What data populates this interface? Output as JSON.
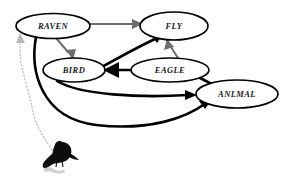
{
  "diagram": {
    "background_color": "#ffffff",
    "nodes": [
      {
        "id": "raven",
        "label": "RAVEN",
        "cx": 53,
        "cy": 26,
        "rx": 37,
        "ry": 12.5
      },
      {
        "id": "fly",
        "label": "FLY",
        "cx": 174,
        "cy": 26,
        "rx": 34,
        "ry": 14
      },
      {
        "id": "bird",
        "label": "BIRD",
        "cx": 74,
        "cy": 70,
        "rx": 31,
        "ry": 12
      },
      {
        "id": "eagle",
        "label": "EAGLE",
        "cx": 170,
        "cy": 70,
        "rx": 39,
        "ry": 12
      },
      {
        "id": "animal",
        "label": "ANLMAL",
        "cx": 237,
        "cy": 94,
        "rx": 41,
        "ry": 14
      }
    ],
    "edges": [
      {
        "id": "raven-fly",
        "from": "RAVEN",
        "to": "FLY",
        "style": "gray",
        "label": ""
      },
      {
        "id": "raven-bird",
        "from": "RAVEN",
        "to": "BIRD",
        "style": "gray",
        "label": ""
      },
      {
        "id": "eagle-fly",
        "from": "EAGLE",
        "to": "FLY",
        "style": "gray",
        "label": ""
      },
      {
        "id": "bird-fly",
        "from": "BIRD",
        "to": "FLY",
        "style": "thick",
        "label": ""
      },
      {
        "id": "eagle-bird",
        "from": "EAGLE",
        "to": "BIRD",
        "style": "thick",
        "label": ""
      },
      {
        "id": "bird-animal",
        "from": "BIRD",
        "to": "ANLMAL",
        "style": "thick",
        "label": ""
      },
      {
        "id": "eagle-animal",
        "from": "EAGLE",
        "to": "ANLMAL",
        "style": "thick",
        "label": ""
      },
      {
        "id": "raven-animal",
        "from": "RAVEN",
        "to": "ANLMAL",
        "style": "thick",
        "label": ""
      },
      {
        "id": "image-raven",
        "from": "raven-illustration",
        "to": "RAVEN",
        "style": "dotted",
        "label": ""
      }
    ],
    "illustration": {
      "name": "raven-illustration",
      "description": "black raven perched on a branch",
      "color": "#0d0d0d"
    },
    "colors": {
      "node_stroke": "#000000",
      "node_fill": "#ffffff",
      "edge_thick": "#000000",
      "edge_gray": "#6e6e6e",
      "edge_dotted": "#b9b9b9",
      "label_text": "#1a1a1a"
    }
  }
}
